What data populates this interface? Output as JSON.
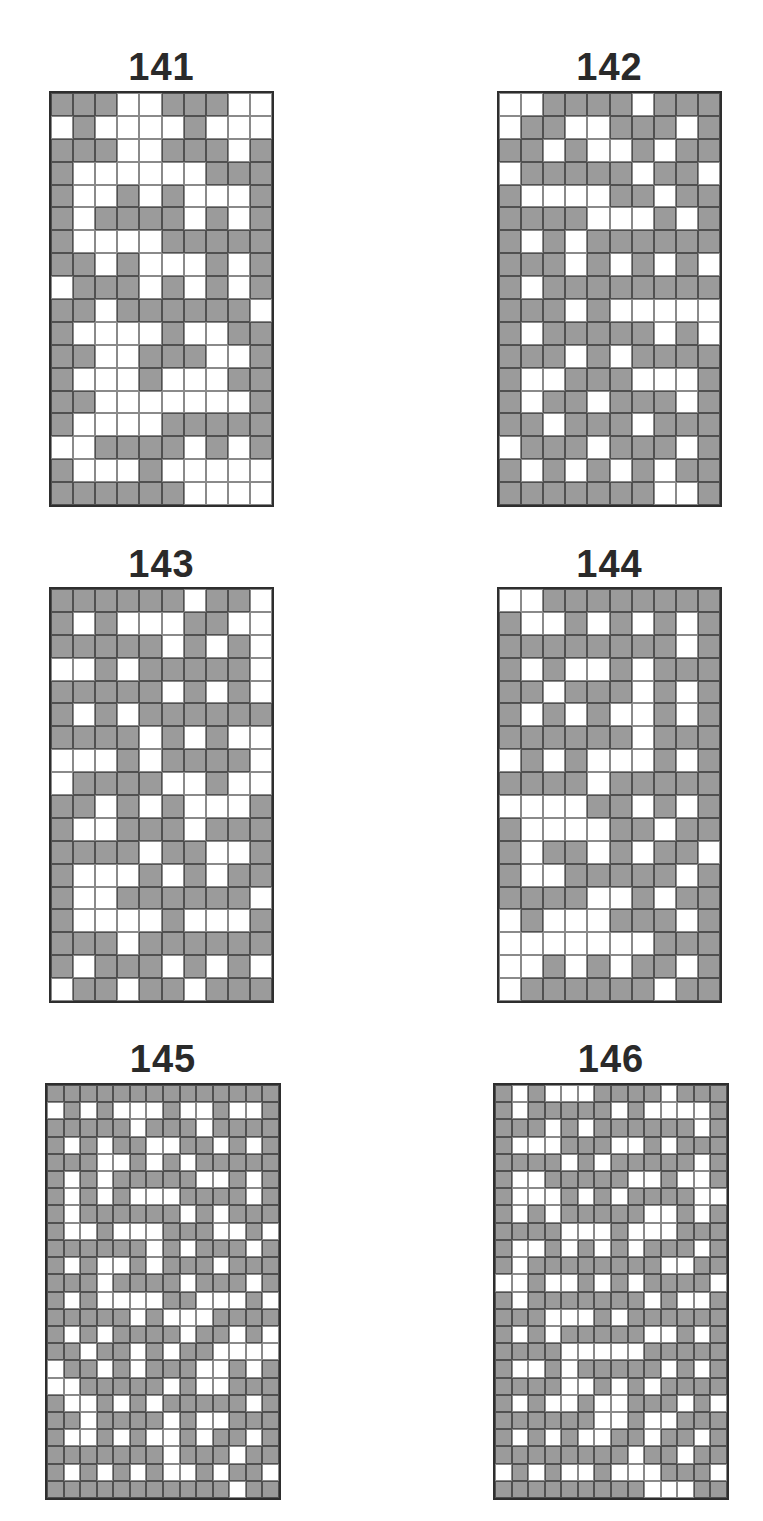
{
  "page": {
    "puzzles": [
      {
        "number": "141",
        "cols": 10,
        "rows": 18,
        "title_pos": {
          "x": 49,
          "y": 48,
          "w": 225
        },
        "grid_pos": {
          "x": 49,
          "y": 91,
          "w": 225,
          "h": 416
        },
        "cells": [
          "GGGWWGGGWW",
          "WGWWWWGWWW",
          "GGGWWGGGWG",
          "GWWWWWWGGG",
          "GWWGWGWWWG",
          "GWGGGGWGWG",
          "GWWWWGGGGG",
          "GGWGWWWGWG",
          "WGGGWGWGWG",
          "GGWGGGGGGW",
          "GWWWWGWWGG",
          "GGWWGGGWWG",
          "GWWWGWWWGG",
          "GGWWWWWWWG",
          "GWWWWGGGGG",
          "WWGGGGWGWG",
          "GWWWGWWWWW",
          "GGGGGGWWWW"
        ]
      },
      {
        "number": "142",
        "cols": 10,
        "rows": 18,
        "title_pos": {
          "x": 497,
          "y": 48,
          "w": 225
        },
        "grid_pos": {
          "x": 497,
          "y": 91,
          "w": 225,
          "h": 416
        },
        "cells": [
          "WWGGGGWGGG",
          "WGGWWGGGWG",
          "GGWGWWGWGG",
          "WGGGGGWGGW",
          "GWWWWGGWGG",
          "GGGGWWWGWG",
          "GWGWGGGGGG",
          "GGGWGWGWGW",
          "GWGGGGGGGG",
          "GGGWGWWWWW",
          "GWGGGGGWGW",
          "GGGWGWGGGG",
          "GWWGGGWWWG",
          "GWGGWGGGWG",
          "GGWGGGWGGG",
          "WGGGWGGGWG",
          "GWGWGWGWGG",
          "GGGGGGGWWG"
        ]
      },
      {
        "number": "143",
        "cols": 10,
        "rows": 18,
        "title_pos": {
          "x": 49,
          "y": 545,
          "w": 225
        },
        "grid_pos": {
          "x": 49,
          "y": 587,
          "w": 225,
          "h": 416
        },
        "cells": [
          "GGGGGGWGGW",
          "GWGWWWGGWW",
          "GGGGGWGWGW",
          "WWGWGGGGGW",
          "GGGGGWGWGW",
          "GWGWGGGGGG",
          "GGGGWGWGWW",
          "WWWGWGGGGW",
          "WGGGGWWGWW",
          "GGWGWGWWWG",
          "GWWGGGWGGG",
          "GGGGWGGWWG",
          "GWWWGWGWGG",
          "GWWGGGGGGW",
          "GWWWWGWWWG",
          "GGGWGGGGGG",
          "GWGGGWGWGW",
          "WGGWGGWGGG"
        ]
      },
      {
        "number": "144",
        "cols": 10,
        "rows": 18,
        "title_pos": {
          "x": 497,
          "y": 545,
          "w": 225
        },
        "grid_pos": {
          "x": 497,
          "y": 587,
          "w": 225,
          "h": 416
        },
        "cells": [
          "WWGGGGGGGG",
          "GWWGWGWGWG",
          "GGGGGGGGWG",
          "GWGWWGWGGG",
          "GGWGGGWGWG",
          "GWGWGWWGWG",
          "GGGGGGWGGG",
          "WGWGWWWGWG",
          "GGGGWGGGGG",
          "WWWWGGWGWG",
          "GWWWWGGWGG",
          "GWGGWGWGGW",
          "GWWGGGGGWG",
          "GGGGWWGWGG",
          "WGWWWGGGWG",
          "WWWWWWWGGG",
          "WWGWGWGGWG",
          "WGGGGGGWGG"
        ]
      },
      {
        "number": "145",
        "cols": 14,
        "rows": 24,
        "title_pos": {
          "x": 45,
          "y": 1040,
          "w": 236
        },
        "grid_pos": {
          "x": 45,
          "y": 1083,
          "w": 236,
          "h": 417
        },
        "cells": [
          "GGGGGGGGGGGGGG",
          "WGWGWWWGWWGWWG",
          "GGGGGWGGGWGGGG",
          "GWGWGGWWGGWGWG",
          "GGGWWGWGWGGGGG",
          "GWGWGGGGGWWGWG",
          "GWGWGWWWGGGGWG",
          "GWGGGGGGWGWGGG",
          "GWWGWWWGGGWWGW",
          "GGGGGGWGWGGGWG",
          "GWGWWGWGGGWGGG",
          "GGGWGGGGWGGGWG",
          "GWGWWWWGGWWWGW",
          "GGGGGWGWWWGGGG",
          "GWGWGGGGWGGWGW",
          "GGWGGWGWGGWWWW",
          "WGGWGWGGGWWGWG",
          "WWGGGGGWGWWGGG",
          "GWWGWGWGGGGGWG",
          "GGWGGGGWGWWGGG",
          "GWWGWGWWGWGGWG",
          "GGGGGGGWGGGWGG",
          "GWGWGWGWWGWGGW",
          "GGGGGGGGGGGWGG"
        ]
      },
      {
        "number": "146",
        "cols": 14,
        "rows": 24,
        "title_pos": {
          "x": 493,
          "y": 1040,
          "w": 236
        },
        "grid_pos": {
          "x": 493,
          "y": 1083,
          "w": 236,
          "h": 417
        },
        "cells": [
          "GWGWWWGGGGWGGG",
          "GWGGGGGWGWWWWG",
          "GGGWGWGGGGGGWG",
          "GWWWGGGWWGWGGG",
          "GGGGWGWGGGGGWG",
          "GWWGGGGGWWGWWG",
          "GWWWGWGWGGGGWW",
          "GWGWGGGGGWWGWG",
          "GGGGWWWGWWWGGG",
          "GWWGWGWGWGGGWG",
          "GWGGGGGGGGWWGG",
          "WWGWWGWGWGGGGW",
          "GWGGGGGGGWGWWG",
          "GGGWWWGWGGGGGG",
          "GWGWGGGGGWWGWG",
          "GGGGWWWWWGGGGG",
          "GWWGWGGGGGWGWG",
          "GGGGWWGWGWGGGG",
          "GWGWWGWWGGGWGW",
          "GGGGGGWWGWWGGG",
          "GWGWGWWGGWGGWG",
          "GGGGGGGGWGGWGG",
          "WGWGWWGWWWGGGW",
          "GGGGGGGGGWWWGG"
        ]
      }
    ],
    "colors": {
      "filled": "#9b9b9b",
      "empty": "#ffffff",
      "border": "#2e2e2e",
      "title": "#2a2a2a"
    }
  }
}
